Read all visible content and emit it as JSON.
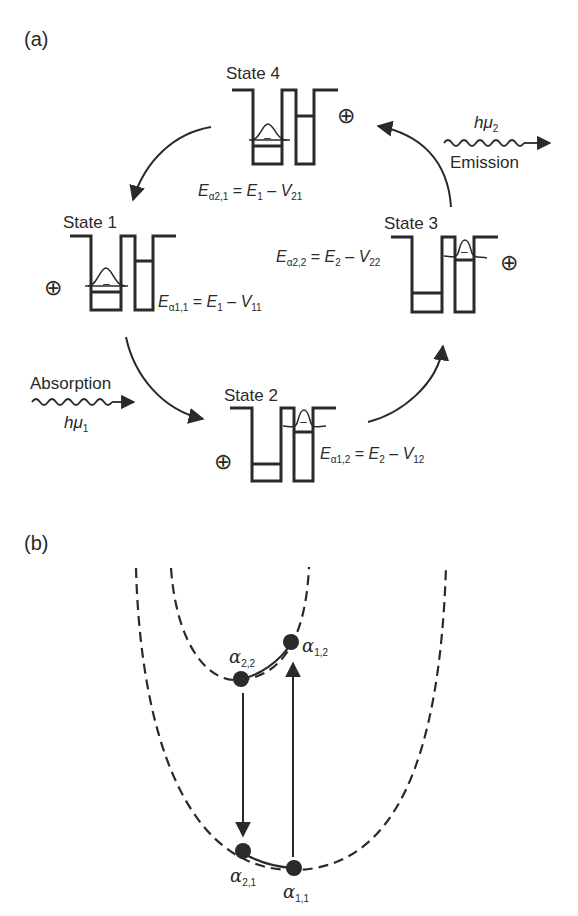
{
  "panel_a": {
    "label": "(a)",
    "states": [
      {
        "name": "State 1",
        "charge": "⊕"
      },
      {
        "name": "State 2",
        "charge": "⊕"
      },
      {
        "name": "State 3",
        "charge": "⊕"
      },
      {
        "name": "State 4",
        "charge": "⊕"
      }
    ],
    "equations": {
      "e_a21": {
        "E": "E",
        "sub": "α2,1",
        "eq": " = ",
        "E2": "E",
        "sub2": "1",
        "minus": " – ",
        "V": "V",
        "vsub": "21"
      },
      "e_a11": {
        "E": "E",
        "sub": "α1,1",
        "eq": " = ",
        "E2": "E",
        "sub2": "1",
        "minus": " – ",
        "V": "V",
        "vsub": "11"
      },
      "e_a22": {
        "E": "E",
        "sub": "α2,2",
        "eq": " = ",
        "E2": "E",
        "sub2": "2",
        "minus": " – ",
        "V": "V",
        "vsub": "22"
      },
      "e_a12": {
        "E": "E",
        "sub": "α1,2",
        "eq": " = ",
        "E2": "E",
        "sub2": "2",
        "minus": " – ",
        "V": "V",
        "vsub": "12"
      }
    },
    "absorption": {
      "label": "Absorption",
      "photon": "hμ",
      "photon_sub": "1"
    },
    "emission": {
      "label": "Emission",
      "photon": "hμ",
      "photon_sub": "2"
    },
    "minus_sign": "–"
  },
  "panel_b": {
    "label": "(b)",
    "points": [
      {
        "name": "α",
        "sub": "2,2"
      },
      {
        "name": "α",
        "sub": "1,2"
      },
      {
        "name": "α",
        "sub": "2,1"
      },
      {
        "name": "α",
        "sub": "1,1"
      }
    ]
  },
  "colors": {
    "ink": "#2a2a2a",
    "background": "#ffffff"
  }
}
